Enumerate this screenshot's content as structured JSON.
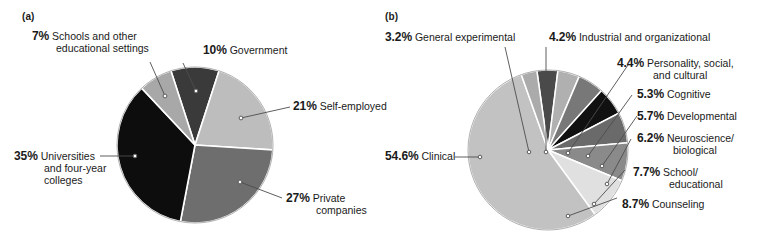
{
  "figure": {
    "background": "#ffffff",
    "panels": [
      {
        "tag": "(a)",
        "chart_data": {
          "type": "pie",
          "title": "",
          "unit": "%",
          "legend": "callout-labels",
          "center": [
            195,
            145
          ],
          "radius": 78,
          "start_angle_deg": -18,
          "categories": [
            "Government",
            "Self-employed",
            "Private companies",
            "Universities and four-year colleges",
            "Schools and other educational settings"
          ],
          "values": [
            10,
            21,
            27,
            35,
            7
          ],
          "colors": [
            "#3a3a3a",
            "#bdbdbd",
            "#6e6e6e",
            "#0d0d0d",
            "#a8a8a8"
          ],
          "labels": [
            {
              "pct": "10%",
              "name": "Government"
            },
            {
              "pct": "21%",
              "name": "Self-employed"
            },
            {
              "pct": "27%",
              "name": "Private",
              "name2": "companies"
            },
            {
              "pct": "35%",
              "name": "Universities",
              "name2": "and four-year",
              "name3": "colleges"
            },
            {
              "pct": "7%",
              "name": "Schools and other",
              "name2": "educational settings"
            }
          ]
        }
      },
      {
        "tag": "(b)",
        "chart_data": {
          "type": "pie",
          "title": "",
          "unit": "%",
          "legend": "callout-labels",
          "center": [
            548,
            150
          ],
          "radius": 80,
          "start_angle_deg": -8,
          "categories": [
            "Industrial and organizational",
            "Personality, social, and cultural",
            "Cognitive",
            "Developmental",
            "Neuroscience/biological",
            "School/educational",
            "Counseling",
            "Clinical",
            "General experimental"
          ],
          "values": [
            4.2,
            4.4,
            5.3,
            5.7,
            6.2,
            7.7,
            8.7,
            54.6,
            3.2
          ],
          "colors": [
            "#4a4a4a",
            "#b0b0b0",
            "#787878",
            "#111111",
            "#6a6a6a",
            "#8a8a8a",
            "#e0e0e0",
            "#c2c2c2",
            "#ababab"
          ],
          "labels": [
            {
              "pct": "4.2%",
              "name": "Industrial and organizational"
            },
            {
              "pct": "4.4%",
              "name": "Personality, social,",
              "name2": "and cultural"
            },
            {
              "pct": "5.3%",
              "name": "Cognitive"
            },
            {
              "pct": "5.7%",
              "name": "Developmental"
            },
            {
              "pct": "6.2%",
              "name": "Neuroscience/",
              "name2": "biological"
            },
            {
              "pct": "7.7%",
              "name": "School/",
              "name2": "educational"
            },
            {
              "pct": "8.7%",
              "name": "Counseling"
            },
            {
              "pct": "54.6%",
              "name": "Clinical"
            },
            {
              "pct": "3.2%",
              "name": "General experimental"
            }
          ]
        }
      }
    ]
  },
  "panel_a": {
    "tag": "(a)",
    "schools": {
      "pct": "7%",
      "l1": "Schools and other",
      "l2": "educational settings"
    },
    "government": {
      "pct": "10%",
      "l1": "Government"
    },
    "self_employed": {
      "pct": "21%",
      "l1": "Self-employed"
    },
    "private": {
      "pct": "27%",
      "l1": "Private",
      "l2": "companies"
    },
    "universities": {
      "pct": "35%",
      "l1": "Universities",
      "l2": "and four-year",
      "l3": "colleges"
    }
  },
  "panel_b": {
    "tag": "(b)",
    "general_experimental": {
      "pct": "3.2%",
      "l1": "General experimental"
    },
    "industrial": {
      "pct": "4.2%",
      "l1": "Industrial and organizational"
    },
    "personality": {
      "pct": "4.4%",
      "l1": "Personality, social,",
      "l2": "and cultural"
    },
    "cognitive": {
      "pct": "5.3%",
      "l1": "Cognitive"
    },
    "developmental": {
      "pct": "5.7%",
      "l1": "Developmental"
    },
    "neuroscience": {
      "pct": "6.2%",
      "l1": "Neuroscience/",
      "l2": "biological"
    },
    "school": {
      "pct": "7.7%",
      "l1": "School/",
      "l2": "educational"
    },
    "counseling": {
      "pct": "8.7%",
      "l1": "Counseling"
    },
    "clinical": {
      "pct": "54.6%",
      "l1": "Clinical"
    }
  }
}
